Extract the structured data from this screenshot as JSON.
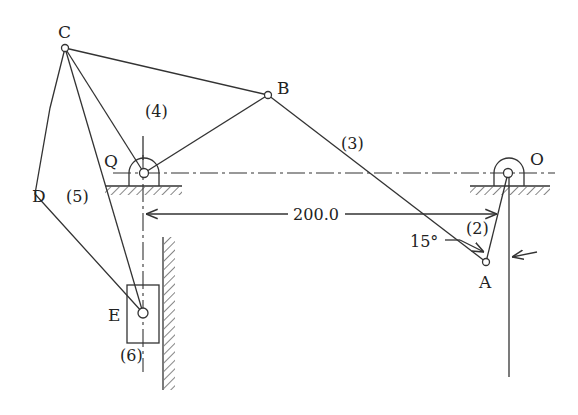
{
  "figure": {
    "type": "planar linkage mechanism schematic",
    "joints": {
      "C": {
        "label": "C",
        "x": 65,
        "y": 48
      },
      "B": {
        "label": "B",
        "x": 268,
        "y": 95
      },
      "Q": {
        "label": "Q",
        "x": 144,
        "y": 173
      },
      "O": {
        "label": "O",
        "x": 508,
        "y": 173
      },
      "A": {
        "label": "A",
        "x": 486,
        "y": 262
      },
      "D": {
        "label": "D",
        "x": 35,
        "y": 194
      },
      "E": {
        "label": "E",
        "x": 143,
        "y": 313
      }
    },
    "links": [
      {
        "id": "2",
        "label": "(2)"
      },
      {
        "id": "3",
        "label": "(3)"
      },
      {
        "id": "4",
        "label": "(4)"
      },
      {
        "id": "5",
        "label": "(5)"
      },
      {
        "id": "6",
        "label": "(6)"
      }
    ],
    "dimension": {
      "value": "200.0"
    },
    "angle": {
      "value": "15°"
    },
    "colors": {
      "line": "#333333",
      "background": "#ffffff"
    }
  }
}
